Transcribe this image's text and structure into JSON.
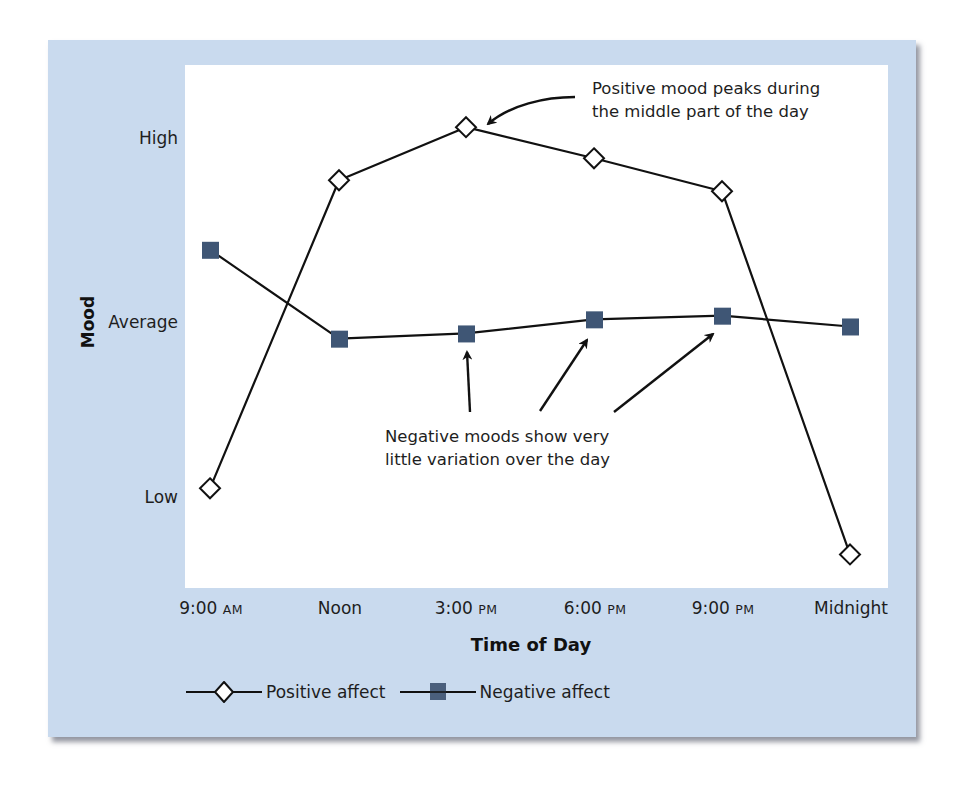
{
  "figure": {
    "background_color": "#c9daee",
    "plot_background": "#ffffff",
    "marker_color_negative": "#3f5675",
    "line_color": "#111111"
  },
  "axes": {
    "y_title": "Mood",
    "y_ticks": [
      {
        "label": "High",
        "value": 3
      },
      {
        "label": "Average",
        "value": 2
      },
      {
        "label": "Low",
        "value": 1
      }
    ],
    "x_title": "Time of Day",
    "x_ticks": [
      {
        "main": "9:00",
        "suffix": "AM"
      },
      {
        "main": "Noon",
        "suffix": ""
      },
      {
        "main": "3:00",
        "suffix": "PM"
      },
      {
        "main": "6:00",
        "suffix": "PM"
      },
      {
        "main": "9:00",
        "suffix": "PM"
      },
      {
        "main": "Midnight",
        "suffix": ""
      }
    ]
  },
  "annotations": {
    "positive_line1": "Positive mood peaks during",
    "positive_line2": "the middle part of the day",
    "negative_line1": "Negative moods show very",
    "negative_line2": "little variation over the day"
  },
  "legend": {
    "positive": "Positive affect",
    "negative": "Negative affect"
  },
  "chart_data": {
    "type": "line",
    "title": "",
    "xlabel": "Time of Day",
    "ylabel": "Mood",
    "categories": [
      "9:00 AM",
      "Noon",
      "3:00 PM",
      "6:00 PM",
      "9:00 PM",
      "Midnight"
    ],
    "y_scale": {
      "Low": 1,
      "Average": 2,
      "High": 3
    },
    "ylim": [
      0.5,
      3.3
    ],
    "grid": false,
    "legend_position": "bottom-left",
    "series": [
      {
        "name": "Positive affect",
        "marker": "open-diamond",
        "values": [
          1.05,
          2.78,
          3.07,
          2.9,
          2.72,
          0.67
        ]
      },
      {
        "name": "Negative affect",
        "marker": "filled-square",
        "values": [
          2.4,
          1.91,
          1.94,
          2.02,
          2.04,
          1.98
        ]
      }
    ],
    "annotations": [
      {
        "text": "Positive mood peaks during the middle part of the day",
        "points_to": "Positive affect @ 3:00 PM"
      },
      {
        "text": "Negative moods show very little variation over the day",
        "points_to": [
          "Negative affect @ 3:00 PM",
          "Negative affect @ 6:00 PM",
          "Negative affect @ 9:00 PM"
        ]
      }
    ]
  }
}
